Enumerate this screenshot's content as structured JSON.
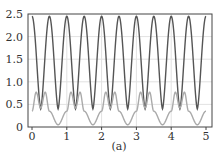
{
  "chart_data": {
    "type": "line",
    "title": "",
    "caption": "(a)",
    "xlabel": "",
    "ylabel": "",
    "xlim": [
      0,
      5
    ],
    "ylim": [
      0,
      2.5
    ],
    "xticks": [
      "0",
      "1",
      "2",
      "3",
      "4",
      "5"
    ],
    "yticks": [
      "0",
      "0.5",
      "1.0",
      "1.5",
      "2.0",
      "2.5"
    ],
    "grid": true,
    "legend": null,
    "series": [
      {
        "name": "dark-curve",
        "color": "#555555",
        "description": "period 0.5, max ≈2.45 at x=0,0.5,1,...; min ≈0.4 at x=0.25,0.75,...",
        "x": [
          0,
          0.25,
          0.5,
          0.75,
          1.0,
          1.25,
          1.5,
          1.75,
          2.0,
          2.25,
          2.5,
          2.75,
          3.0,
          3.25,
          3.5,
          3.75,
          4.0,
          4.25,
          4.5,
          4.75,
          5.0
        ],
        "values": [
          2.45,
          0.4,
          2.45,
          0.4,
          2.45,
          0.4,
          2.45,
          0.4,
          2.45,
          0.4,
          2.45,
          0.4,
          2.45,
          0.4,
          2.45,
          0.4,
          2.45,
          0.4,
          2.45,
          0.4,
          2.45
        ]
      },
      {
        "name": "light-curve",
        "color": "#aaaaaa",
        "description": "period 1; ≈0.35 at x=0, peaks ≈0.77 at x≈0.12 and 0.38, local dip ≈0.42 at 0.25, min ≈0.05 at 0.75",
        "x": [
          0,
          0.12,
          0.25,
          0.38,
          0.5,
          0.75,
          1.0
        ],
        "values": [
          0.35,
          0.77,
          0.42,
          0.77,
          0.35,
          0.05,
          0.35
        ]
      }
    ]
  }
}
